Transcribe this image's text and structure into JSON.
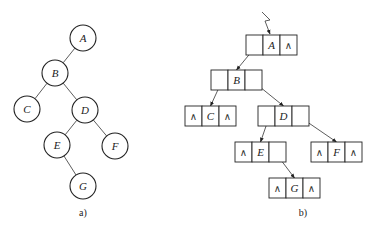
{
  "panel_a": {
    "caption": "a)",
    "nodes": [
      {
        "id": "A",
        "label": "A",
        "cx": 83,
        "cy": 38
      },
      {
        "id": "B",
        "label": "B",
        "cx": 55,
        "cy": 73
      },
      {
        "id": "C",
        "label": "C",
        "cx": 27,
        "cy": 109
      },
      {
        "id": "D",
        "label": "D",
        "cx": 85,
        "cy": 110
      },
      {
        "id": "E",
        "label": "E",
        "cx": 57,
        "cy": 145
      },
      {
        "id": "F",
        "label": "F",
        "cx": 115,
        "cy": 146
      },
      {
        "id": "G",
        "label": "G",
        "cx": 83,
        "cy": 186
      }
    ],
    "edges": [
      [
        "A",
        "B"
      ],
      [
        "B",
        "C"
      ],
      [
        "B",
        "D"
      ],
      [
        "D",
        "E"
      ],
      [
        "D",
        "F"
      ],
      [
        "E",
        "G"
      ]
    ]
  },
  "panel_b": {
    "caption": "b)",
    "null_symbol": "∧",
    "nodes": [
      {
        "id": "A",
        "label": "A",
        "x": 246,
        "y": 35,
        "left": "",
        "right": "∧"
      },
      {
        "id": "B",
        "label": "B",
        "x": 211,
        "y": 70,
        "left": "",
        "right": ""
      },
      {
        "id": "C",
        "label": "C",
        "x": 185,
        "y": 106,
        "left": "∧",
        "right": "∧"
      },
      {
        "id": "D",
        "label": "D",
        "x": 258,
        "y": 106,
        "left": "",
        "right": ""
      },
      {
        "id": "E",
        "label": "E",
        "x": 235,
        "y": 142,
        "left": "∧",
        "right": ""
      },
      {
        "id": "F",
        "label": "F",
        "x": 311,
        "y": 142,
        "left": "∧",
        "right": "∧"
      },
      {
        "id": "G",
        "label": "G",
        "x": 269,
        "y": 178,
        "left": "∧",
        "right": "∧"
      }
    ],
    "edges": [
      {
        "from": "A",
        "side": "left",
        "to": "B"
      },
      {
        "from": "B",
        "side": "left",
        "to": "C"
      },
      {
        "from": "B",
        "side": "right",
        "to": "D"
      },
      {
        "from": "D",
        "side": "left",
        "to": "E"
      },
      {
        "from": "D",
        "side": "right",
        "to": "F"
      },
      {
        "from": "E",
        "side": "right",
        "to": "G"
      }
    ]
  }
}
